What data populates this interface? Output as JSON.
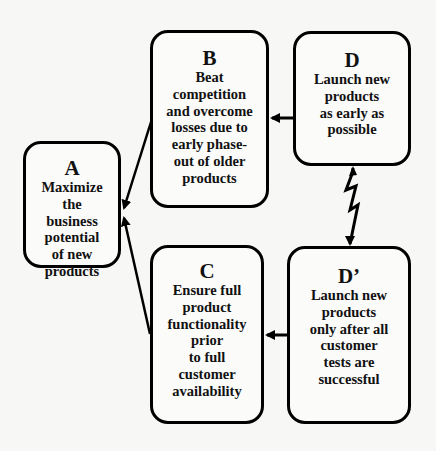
{
  "diagram": {
    "type": "flow-conflict-diagram",
    "nodes": [
      {
        "id": "A",
        "letter": "A",
        "text": "Maximize\nthe\nbusiness\npotential\nof new\nproducts"
      },
      {
        "id": "B",
        "letter": "B",
        "text": "Beat\ncompetition\nand overcome\nlosses due to\nearly phase-\nout of older\nproducts"
      },
      {
        "id": "C",
        "letter": "C",
        "text": "Ensure full\nproduct\nfunctionality\nprior\nto full\ncustomer\navailability"
      },
      {
        "id": "D",
        "letter": "D",
        "text": "Launch new\nproducts\nas early as\npossible"
      },
      {
        "id": "D'",
        "letter": "D’",
        "text": "Launch new\nproducts\nonly after all\ncustomer\ntests are\nsuccessful"
      }
    ],
    "edges": [
      {
        "from": "B",
        "to": "A",
        "style": "arrow"
      },
      {
        "from": "C",
        "to": "A",
        "style": "arrow"
      },
      {
        "from": "D",
        "to": "B",
        "style": "arrow"
      },
      {
        "from": "D'",
        "to": "C",
        "style": "arrow"
      },
      {
        "from": "D",
        "to": "D'",
        "style": "lightning-conflict",
        "bidirectional": true
      }
    ],
    "colors": {
      "background": "#f7f7f5",
      "stroke": "#000000",
      "text": "#111111"
    }
  }
}
